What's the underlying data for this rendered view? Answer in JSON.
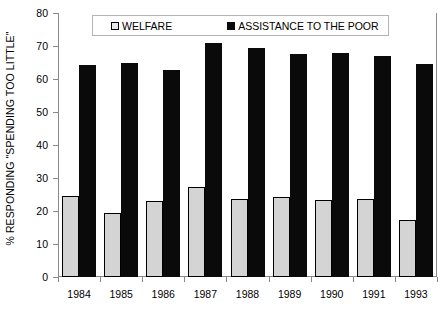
{
  "chart_data": {
    "type": "bar",
    "title": "",
    "xlabel": "",
    "ylabel": "% RESPONDING \"SPENDING TOO LITTLE\"",
    "categories": [
      "1984",
      "1985",
      "1986",
      "1987",
      "1988",
      "1989",
      "1990",
      "1991",
      "1993"
    ],
    "series": [
      {
        "name": "WELFARE",
        "color": "#d4d4d4",
        "values": [
          24.5,
          19.3,
          23.1,
          27.4,
          23.5,
          24.1,
          23.2,
          23.5,
          17.2
        ]
      },
      {
        "name": "ASSISTANCE TO THE POOR",
        "color": "#0a0a0a",
        "values": [
          64.1,
          64.7,
          62.8,
          70.8,
          69.5,
          67.6,
          67.8,
          67.0,
          64.6
        ]
      }
    ],
    "ylim": [
      0,
      80
    ],
    "ytick_values": [
      0,
      10,
      20,
      30,
      40,
      50,
      60,
      70,
      80
    ],
    "ytick_labels": [
      "0",
      "10",
      "20",
      "30",
      "40",
      "50",
      "60",
      "70",
      "80"
    ],
    "grid": false,
    "legend_position": "top-center"
  },
  "legend": {
    "items": [
      {
        "label": "WELFARE",
        "swatch": "open-square-light"
      },
      {
        "label": "ASSISTANCE TO THE POOR",
        "swatch": "filled-square-black"
      }
    ]
  },
  "axis": {
    "y_title": "% RESPONDING \"SPENDING TOO LITTLE\""
  }
}
